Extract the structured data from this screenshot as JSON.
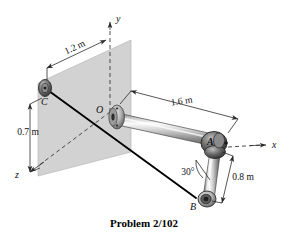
{
  "figure": {
    "caption": "Problem 2/102",
    "background_color": "#ffffff",
    "ink_color": "#111111",
    "plate_color": "#d2d2d2",
    "plate_edge_color": "#9a9a9a",
    "pipe_light": "#f2f2f2",
    "pipe_mid": "#b4b4b4",
    "pipe_dark": "#6e6e6e",
    "joint_dark": "#3c3c3c",
    "cable_color": "#000000"
  },
  "axes": {
    "y_label": "y",
    "x_label": "x",
    "z_label": "z"
  },
  "points": {
    "O": "O",
    "A": "A",
    "B": "B",
    "C": "C"
  },
  "dimensions": {
    "plate_width": "1.2 m",
    "plate_height": "0.7 m",
    "pipe_oa": "1.6 m",
    "pipe_ab": "0.8 m",
    "elbow_angle": "30°"
  }
}
